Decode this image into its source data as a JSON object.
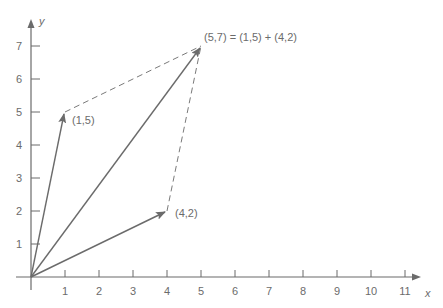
{
  "diagram": {
    "type": "vector-addition",
    "axes": {
      "x_label": "x",
      "y_label": "y",
      "x_ticks": [
        "1",
        "2",
        "3",
        "4",
        "5",
        "6",
        "7",
        "8",
        "9",
        "10",
        "11"
      ],
      "y_ticks": [
        "1",
        "2",
        "3",
        "4",
        "5",
        "6",
        "7"
      ],
      "x_range": [
        0,
        11.5
      ],
      "y_range": [
        0,
        7.5
      ]
    },
    "vectors": [
      {
        "name": "a",
        "from": [
          0,
          0
        ],
        "to": [
          1,
          5
        ],
        "label": "(1,5)"
      },
      {
        "name": "b",
        "from": [
          0,
          0
        ],
        "to": [
          4,
          2
        ],
        "label": "(4,2)"
      },
      {
        "name": "sum",
        "from": [
          0,
          0
        ],
        "to": [
          5,
          7
        ],
        "label": "(5,7) = (1,5) + (4,2)"
      }
    ],
    "dashed_lines": [
      {
        "from": [
          1,
          5
        ],
        "to": [
          5,
          7
        ]
      },
      {
        "from": [
          4,
          2
        ],
        "to": [
          5,
          7
        ]
      }
    ],
    "colors": {
      "axis": "#6b6b6b",
      "vector": "#6b6b6b",
      "text": "#6b6b6b"
    }
  }
}
